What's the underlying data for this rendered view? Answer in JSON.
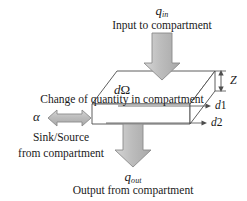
{
  "diagram": {
    "colors": {
      "arrow_fill": "#b3b3b3",
      "arrow_fill_light": "#c9c9c9",
      "arrow_stroke": "#6e6e6e",
      "box_stroke": "#4d4d4d",
      "box_face": "#ffffff",
      "text": "#1a1a1a"
    },
    "labels": {
      "q_in_symbol": "q",
      "q_in_subscript": "in",
      "q_in_caption": "Input to compartment",
      "q_out_symbol": "q",
      "q_out_subscript": "out",
      "q_out_caption": "Output from compartment",
      "alpha_symbol": "α",
      "alpha_caption_line1": "Sink/Source",
      "alpha_caption_line2": "from compartment",
      "d_omega_d": "d",
      "d_omega_symbol": "Ω",
      "d_omega_caption": "Change of quantity in compartment",
      "dim_z": "Z",
      "dim_d1_d": "d",
      "dim_d1_n": "1",
      "dim_d2_d": "d",
      "dim_d2_n": "2"
    }
  }
}
